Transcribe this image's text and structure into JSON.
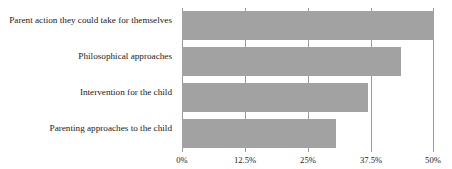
{
  "chart_data": {
    "type": "bar",
    "orientation": "horizontal",
    "title": "",
    "subtitle": "",
    "xlabel": "",
    "ylabel": "",
    "categories": [
      "Parent action they could take for themselves",
      "Philosophical approaches",
      "Intervention for the child",
      "Parenting approaches to the child"
    ],
    "values": [
      50,
      43.5,
      37,
      30.5
    ],
    "value_unit": "%",
    "xlim": [
      0,
      50
    ],
    "ylim": null,
    "xticks": [
      0,
      12.5,
      25,
      37.5,
      50
    ],
    "xtick_labels": [
      "0%",
      "12.5%",
      "25%",
      "37.5%",
      "50%"
    ],
    "grid": "vertical",
    "legend": null,
    "legend_position": "none",
    "series": [
      {
        "name": "",
        "values": [
          50,
          43.5,
          37,
          30.5
        ]
      }
    ],
    "colors": {
      "bar_fill": "#a2a2a2",
      "gridline": "#9a9a9a",
      "text": "#1a1a1a",
      "background": "#ffffff"
    }
  }
}
